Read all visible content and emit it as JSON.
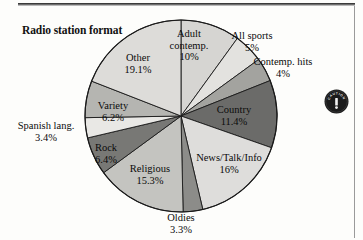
{
  "page": {
    "background_color": "#fdfdfb",
    "rule_color": "#3a3a3a"
  },
  "chart_title": "Radio station\nformat",
  "badge": {
    "name": "caution-badge",
    "curved_text": "CAUTION",
    "glyph": "!",
    "color": "#1b1b1b"
  },
  "labels": {
    "other": "Other\n19.1%",
    "adult_contemp": "Adult\ncontemp.\n10%",
    "all_sports": "All sports\n5%",
    "contemp_hits": "Contemp. hits\n4%",
    "country": "Country\n11.4%",
    "news_talk_info": "News/Talk/Info\n16%",
    "oldies": "Oldies\n3.3%",
    "religious": "Religious\n15.3%",
    "rock": "Rock\n6.4%",
    "spanish_lang": "Spanish lang.\n3.4%",
    "variety": "Variety\n6.2%"
  },
  "chart_data": {
    "type": "pie",
    "title": "Radio station format",
    "xlabel": "",
    "ylabel": "",
    "units": "percent",
    "start_angle_deg": 90,
    "direction": "clockwise",
    "center_px": [
      181,
      116
    ],
    "radius_px": 96,
    "legend": "none (labels on/around slices)",
    "categories": [
      "Adult contemp.",
      "All sports",
      "Contemp. hits",
      "Country",
      "News/Talk/Info",
      "Oldies",
      "Religious",
      "Rock",
      "Spanish lang.",
      "Variety",
      "Other"
    ],
    "values": [
      10,
      5,
      4,
      11.4,
      16,
      3.3,
      15.3,
      6.4,
      3.4,
      6.2,
      19.1
    ],
    "value_labels": [
      "10%",
      "5%",
      "4%",
      "11.4%",
      "16%",
      "3.3%",
      "15.3%",
      "6.4%",
      "3.4%",
      "6.2%",
      "19.1%"
    ],
    "slice_colors": [
      "#d3d3d0",
      "#e6e5e2",
      "#a9a9a6",
      "#6e6e6c",
      "#dcdbd8",
      "#8f8f8c",
      "#c2c2bf",
      "#74747"
    ],
    "slices": [
      {
        "label": "Adult contemp.",
        "value": 10,
        "value_label": "10%",
        "color": "#d6d5d2",
        "label_placement": "inside"
      },
      {
        "label": "All sports",
        "value": 5,
        "value_label": "5%",
        "color": "#e3e2df",
        "label_placement": "outside"
      },
      {
        "label": "Contemp. hits",
        "value": 4,
        "value_label": "4%",
        "color": "#a3a39f",
        "label_placement": "outside"
      },
      {
        "label": "Country",
        "value": 11.4,
        "value_label": "11.4%",
        "color": "#6b6b69",
        "label_placement": "inside"
      },
      {
        "label": "News/Talk/Info",
        "value": 16,
        "value_label": "16%",
        "color": "#dedddа",
        "label_placement": "inside"
      },
      {
        "label": "Oldies",
        "value": 3.3,
        "value_label": "3.3%",
        "color": "#8c8c89",
        "label_placement": "outside"
      },
      {
        "label": "Religious",
        "value": 15.3,
        "value_label": "15.3%",
        "color": "#c4c4c0",
        "label_placement": "inside"
      },
      {
        "label": "Rock",
        "value": 6.4,
        "value_label": "6.4%",
        "color": "#78787 5",
        "label_placement": "inside"
      },
      {
        "label": "Spanish lang.",
        "value": 3.4,
        "value_label": "3.4%",
        "color": "#e9e8e5",
        "label_placement": "outside"
      },
      {
        "label": "Variety",
        "value": 6.2,
        "value_label": "6.2%",
        "color": "#b5b5b1",
        "label_placement": "inside"
      },
      {
        "label": "Other",
        "value": 19.1,
        "value_label": "19.1%",
        "color": "#dddcd9",
        "label_placement": "inside"
      }
    ]
  }
}
